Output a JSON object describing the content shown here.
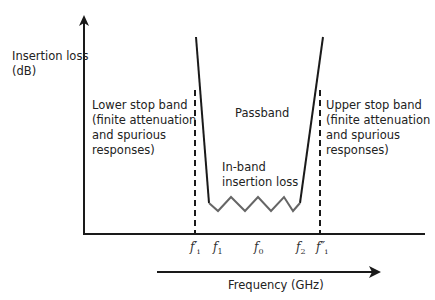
{
  "diagram": {
    "y_axis_label_line1": "Insertion loss",
    "y_axis_label_line2": "(dB)",
    "x_axis_label": "Frequency (GHz)",
    "regions": {
      "lower_stop": [
        "Lower stop band",
        "(finite attenuation",
        "and spurious",
        "responses)"
      ],
      "passband": "Passband",
      "in_band": [
        "In-band",
        "insertion loss"
      ],
      "upper_stop": [
        "Upper stop band",
        "(finite attenuation",
        "and spurious",
        "responses)"
      ]
    },
    "ticks": {
      "fi_prime": "f",
      "fi_prime_sub": "i",
      "fi_prime_mark": "′",
      "f1": "f",
      "f1_sub": "1",
      "f0": "f",
      "f0_sub": "0",
      "f2": "f",
      "f2_sub": "2",
      "fi_dprime": "f",
      "fi_dprime_sub": "i",
      "fi_dprime_mark": "″"
    },
    "colors": {
      "axis": "#1a1a1a",
      "curve": "#1a1a1a",
      "ripple": "#666666"
    }
  }
}
